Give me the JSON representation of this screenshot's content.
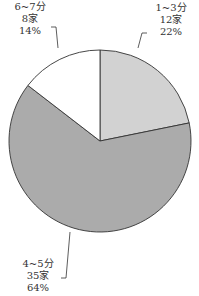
{
  "chart_data": {
    "type": "pie",
    "title": "",
    "categories": [
      "1~3分",
      "4~5分",
      "6~7分"
    ],
    "values": [
      12,
      35,
      8
    ],
    "percentages": [
      "22%",
      "64%",
      "14%"
    ],
    "series": [
      {
        "name": "家数",
        "values": [
          12,
          35,
          8
        ]
      }
    ],
    "colors": [
      "#d2d2d2",
      "#ababab",
      "#ffffff"
    ],
    "legend": "none (callout labels)"
  },
  "labels": [
    {
      "range": "1~3分",
      "count": "12家",
      "pct": "22%"
    },
    {
      "range": "4~5分",
      "count": "35家",
      "pct": "64%"
    },
    {
      "range": "6~7分",
      "count": "8家",
      "pct": "14%"
    }
  ]
}
